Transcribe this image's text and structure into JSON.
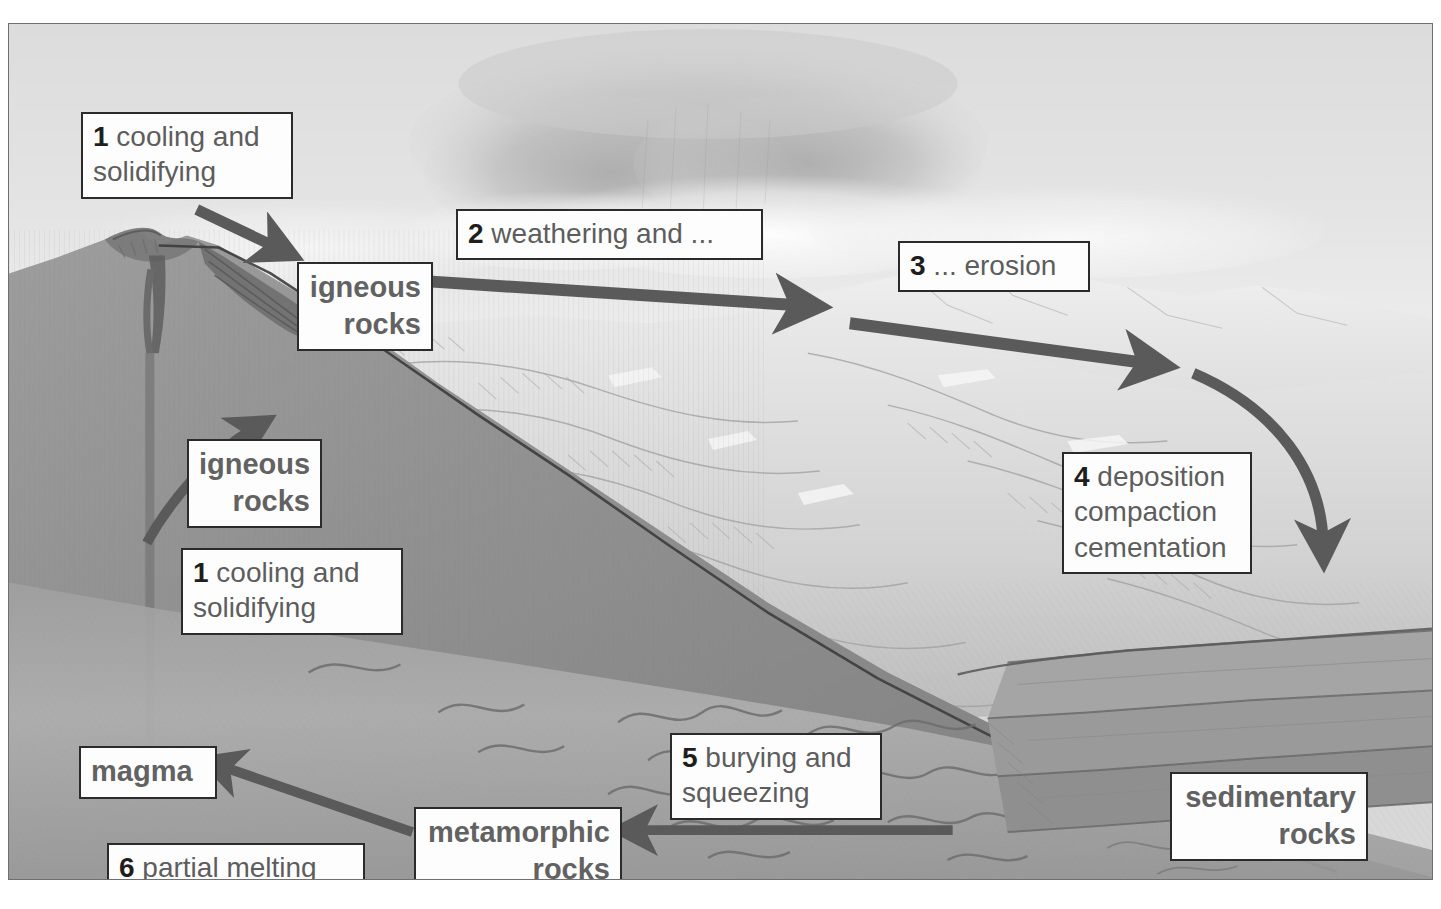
{
  "diagram": {
    "style": "pencil-shaded grayscale landscape with labelled callout boxes",
    "palette": {
      "box_fill": "#fdfdfd",
      "box_border": "#2b2b2b",
      "number_color": "#1e1e1e",
      "label_text": "#5d5d5d",
      "arrow_color": "#5a5a5a",
      "sky_light": "#ececec",
      "sky_mid": "#d5d5d5",
      "cloud_dark": "#b9b9b9",
      "mountain_light": "#e6e6e6",
      "mountain_mid": "#cfcfcf",
      "ground_dark": "#8e8e8e",
      "ground_darker": "#7a7a7a",
      "deep_rock": "#9a9a9a",
      "plate_border": "#6f6f6f"
    }
  },
  "labels": {
    "cooling_1": {
      "number": "1",
      "text": " cooling and\nsolidifying"
    },
    "weathering": {
      "number": "2",
      "text": " weathering and ..."
    },
    "erosion": {
      "number": "3",
      "text": " ... erosion"
    },
    "igneous_top": {
      "text": "igneous\nrocks"
    },
    "igneous_mid": {
      "text": "igneous\nrocks"
    },
    "cooling_2": {
      "number": "1",
      "text": " cooling and\nsolidifying"
    },
    "deposition": {
      "number": "4",
      "text": " deposition\ncompaction\ncementation"
    },
    "burying": {
      "number": "5",
      "text": " burying and\nsqueezing"
    },
    "magma": {
      "text": "magma"
    },
    "partial_melting": {
      "number": "6",
      "text": " partial melting"
    },
    "metamorphic": {
      "text": "metamorphic\nrocks"
    },
    "sedimentary": {
      "text": "sedimentary\nrocks"
    }
  },
  "process_steps": [
    {
      "step": "1",
      "name": "cooling and solidifying",
      "from": "magma",
      "to": "igneous rocks"
    },
    {
      "step": "2",
      "name": "weathering and ...",
      "from": "igneous rocks",
      "to": "sediment"
    },
    {
      "step": "3",
      "name": "... erosion",
      "from": "sediment",
      "to": "transported sediment"
    },
    {
      "step": "4",
      "name": "deposition compaction cementation",
      "from": "sediment",
      "to": "sedimentary rocks"
    },
    {
      "step": "5",
      "name": "burying and squeezing",
      "from": "sedimentary rocks",
      "to": "metamorphic rocks"
    },
    {
      "step": "6",
      "name": "partial melting",
      "from": "metamorphic rocks",
      "to": "magma"
    }
  ],
  "rock_types": [
    "igneous rocks",
    "sedimentary rocks",
    "metamorphic rocks",
    "magma"
  ],
  "arrows": [
    {
      "name": "magma-to-igneous-surface",
      "direction": "up-right",
      "style": "straight"
    },
    {
      "name": "magma-rise-conduit",
      "direction": "up",
      "style": "straight"
    },
    {
      "name": "cooling-to-volcano-flank",
      "direction": "down-right",
      "style": "straight"
    },
    {
      "name": "igneous-to-weathering",
      "direction": "right",
      "style": "straight"
    },
    {
      "name": "weathering-to-erosion",
      "direction": "right-down",
      "style": "straight"
    },
    {
      "name": "erosion-to-deposition",
      "direction": "curved-down",
      "style": "curved"
    },
    {
      "name": "sedimentary-to-metamorphic",
      "direction": "left",
      "style": "straight"
    },
    {
      "name": "metamorphic-to-magma",
      "direction": "up-left",
      "style": "straight"
    }
  ]
}
